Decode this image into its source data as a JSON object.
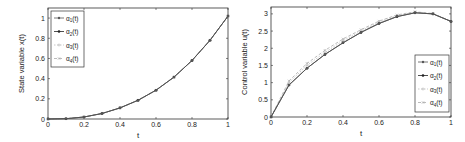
{
  "chart_data": [
    {
      "type": "line",
      "title": "",
      "xlabel": "t",
      "ylabel": "State variable x(t)",
      "xlim": [
        0,
        1
      ],
      "ylim": [
        0,
        1.1
      ],
      "xticks": [
        "0",
        "0.2",
        "0.4",
        "0.6",
        "0.8",
        "1"
      ],
      "yticks": [
        "0",
        "0.2",
        "0.4",
        "0.6",
        "0.8",
        "1"
      ],
      "grid": false,
      "legend_position": "upper left",
      "x": [
        0,
        0.1,
        0.2,
        0.3,
        0.4,
        0.5,
        0.6,
        0.7,
        0.8,
        0.9,
        1.0
      ],
      "series": [
        {
          "name": "α1(t)",
          "values": [
            0,
            0.003,
            0.02,
            0.055,
            0.11,
            0.185,
            0.285,
            0.415,
            0.58,
            0.78,
            1.02
          ]
        },
        {
          "name": "α2(t)",
          "values": [
            0,
            0.003,
            0.02,
            0.055,
            0.11,
            0.185,
            0.285,
            0.415,
            0.58,
            0.78,
            1.02
          ]
        },
        {
          "name": "α3(t)",
          "values": [
            0,
            0.003,
            0.02,
            0.055,
            0.11,
            0.185,
            0.285,
            0.415,
            0.58,
            0.78,
            1.02
          ]
        },
        {
          "name": "α4(t)",
          "values": [
            0,
            0.003,
            0.02,
            0.055,
            0.11,
            0.185,
            0.285,
            0.415,
            0.58,
            0.78,
            1.02
          ]
        }
      ]
    },
    {
      "type": "line",
      "title": "",
      "xlabel": "t",
      "ylabel": "Control variable u(t)",
      "xlim": [
        0,
        1
      ],
      "ylim": [
        0,
        3.2
      ],
      "xticks": [
        "0",
        "0.2",
        "0.4",
        "0.6",
        "0.8",
        "1"
      ],
      "yticks": [
        "0",
        "0.5",
        "1",
        "1.5",
        "2",
        "2.5",
        "3"
      ],
      "grid": false,
      "legend_position": "lower right",
      "x": [
        0,
        0.1,
        0.2,
        0.3,
        0.4,
        0.5,
        0.6,
        0.7,
        0.8,
        0.9,
        1.0
      ],
      "series": [
        {
          "name": "α1(t)",
          "values": [
            0,
            0.93,
            1.42,
            1.82,
            2.16,
            2.46,
            2.72,
            2.92,
            3.03,
            3.0,
            2.78
          ]
        },
        {
          "name": "α2(t)",
          "values": [
            0,
            0.93,
            1.42,
            1.82,
            2.16,
            2.46,
            2.72,
            2.92,
            3.03,
            3.0,
            2.78
          ]
        },
        {
          "name": "α3(t)",
          "values": [
            0,
            1.0,
            1.5,
            1.88,
            2.22,
            2.5,
            2.76,
            2.95,
            3.05,
            3.0,
            2.78
          ]
        },
        {
          "name": "α4(t)",
          "values": [
            0,
            1.05,
            1.56,
            1.94,
            2.27,
            2.54,
            2.79,
            2.97,
            3.06,
            3.01,
            2.78
          ]
        }
      ]
    }
  ]
}
